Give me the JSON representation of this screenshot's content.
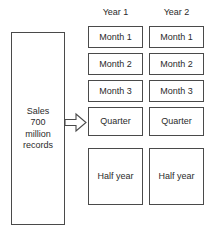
{
  "diagram": {
    "source": {
      "label": "Sales\n700\nmillion\nrecords",
      "text_lines": [
        "Sales",
        "700",
        "million",
        "records"
      ]
    },
    "arrow": {
      "icon": "arrow-right-outline-icon",
      "direction": "right"
    },
    "columns": [
      {
        "header": "Year 1",
        "cells": [
          {
            "label": "Month 1",
            "size": "month"
          },
          {
            "label": "Month 2",
            "size": "month"
          },
          {
            "label": "Month 3",
            "size": "month"
          },
          {
            "label": "Quarter",
            "size": "quarter"
          },
          {
            "label": "Half year",
            "size": "halfyear"
          }
        ]
      },
      {
        "header": "Year 2",
        "cells": [
          {
            "label": "Month 1",
            "size": "month"
          },
          {
            "label": "Month 2",
            "size": "month"
          },
          {
            "label": "Month 3",
            "size": "month"
          },
          {
            "label": "Quarter",
            "size": "quarter"
          },
          {
            "label": "Half year",
            "size": "halfyear"
          }
        ]
      }
    ],
    "colors": {
      "border": "#4a4a4a",
      "text": "#2b2b2b",
      "background": "#ffffff"
    }
  }
}
